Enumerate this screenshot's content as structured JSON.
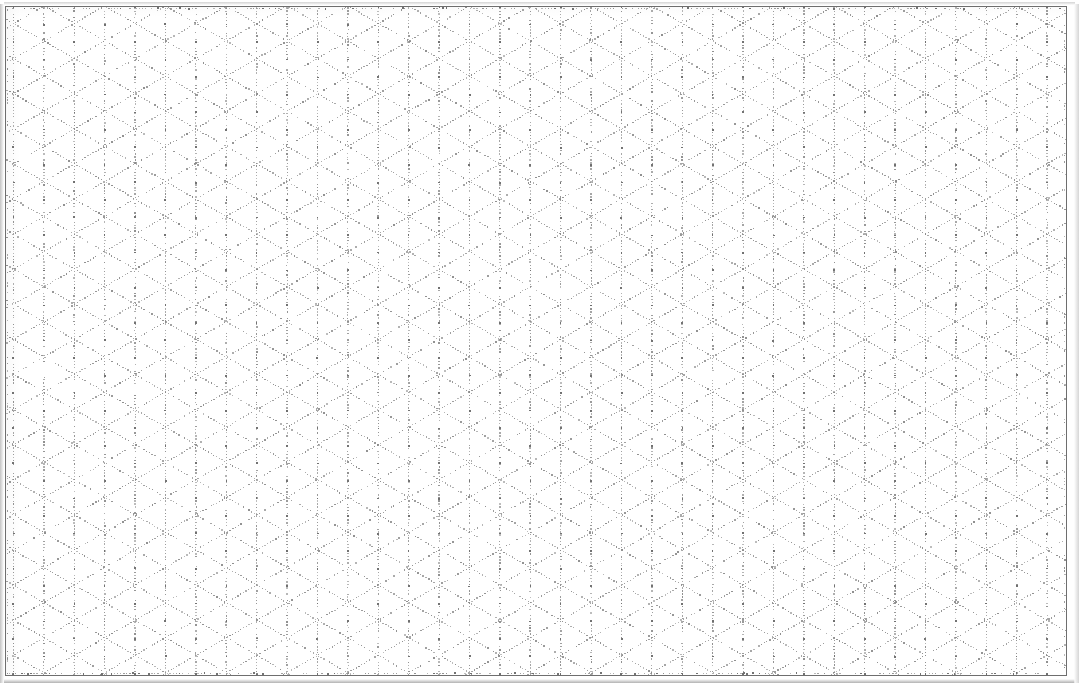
{
  "document": {
    "kind": "isometric-dot-grid-paper",
    "title": "Isometric Dot Grid Paper",
    "orientation": "landscape",
    "page_width_px": 1079,
    "page_height_px": 687,
    "background_color": "#ffffff",
    "has_text": false,
    "has_labels": false,
    "notes": ""
  },
  "frame": {
    "visible": true,
    "x": 5,
    "y": 6,
    "width": 1062,
    "height": 670,
    "stroke_color": "#6e6e6e",
    "stroke_width": 1
  },
  "grid": {
    "style": "dotted",
    "lattice": "triangular-isometric",
    "dot_color": "#8a8a8a",
    "dot_color_dark": "#6b6b6b",
    "dot_size_px": 1.4,
    "dot_spacing_px": 3.1,
    "vertical_line_spacing_px": 30.4,
    "row_pitch_px": 35.1,
    "diagonal_angle_deg": 60,
    "vertical_line_count": 36,
    "row_count": 20,
    "line_families": [
      "vertical",
      "diagonal-up-right",
      "diagonal-down-right"
    ]
  },
  "scan": {
    "edge_shadow_left": true,
    "edge_shadow_top": true,
    "edge_shadow_bottom": true,
    "edge_shadow_right": true,
    "edge_shadow_color": "#b9b9b9"
  }
}
